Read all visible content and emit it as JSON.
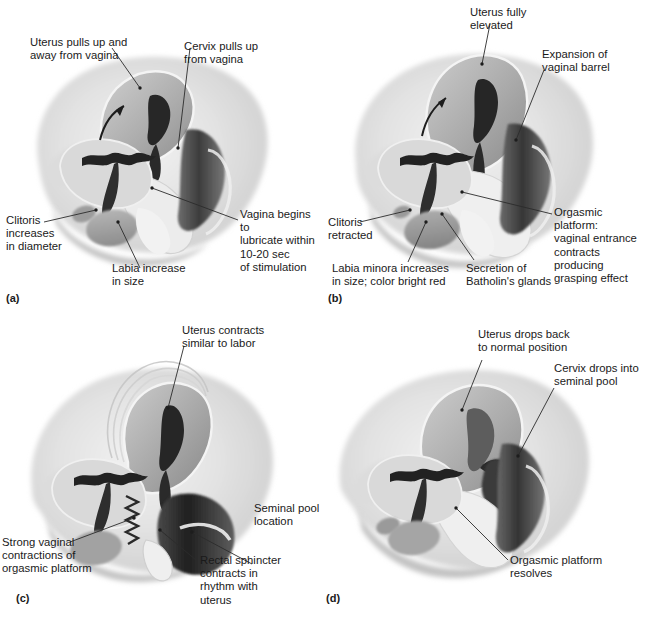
{
  "figure": {
    "panel_count": 4
  },
  "panels": [
    {
      "letter": "(a)",
      "phase_name": "Excitement phase",
      "callouts": [
        {
          "id": "uterus-pulls-up",
          "text": "Uterus pulls up and\naway from vagina"
        },
        {
          "id": "cervix-pulls-up",
          "text": "Cervix pulls up\nfrom vagina"
        },
        {
          "id": "vagina-lubricates",
          "text": "Vagina begins to\nlubricate within\n10-20 sec\nof stimulation"
        },
        {
          "id": "clitoris-increases",
          "text": "Clitoris\nincreases\nin diameter"
        },
        {
          "id": "labia-increase",
          "text": "Labia increase\nin size"
        }
      ]
    },
    {
      "letter": "(b)",
      "phase_name": "Plateau phase",
      "callouts": [
        {
          "id": "uterus-fully-elevated",
          "text": "Uterus fully\nelevated"
        },
        {
          "id": "expansion-vaginal-barrel",
          "text": "Expansion of\nvaginal barrel"
        },
        {
          "id": "orgasmic-platform",
          "text": "Orgasmic platform:\nvaginal entrance\ncontracts producing\ngrasping effect"
        },
        {
          "id": "clitoris-retracted",
          "text": "Clitoris\nretracted"
        },
        {
          "id": "labia-minora-increases",
          "text": "Labia minora increases\nin size; color bright red"
        },
        {
          "id": "secretion-batholins",
          "text": "Secretion of\nBatholin's glands"
        }
      ]
    },
    {
      "letter": "(c)",
      "phase_name": "Orgasm phase",
      "callouts": [
        {
          "id": "uterus-contracts",
          "text": "Uterus contracts\nsimilar to labor"
        },
        {
          "id": "seminal-pool-location",
          "text": "Seminal pool\nlocation"
        },
        {
          "id": "strong-vaginal-contractions",
          "text": "Strong vaginal\ncontractions of\norgasmic platform"
        },
        {
          "id": "rectal-sphincter-contracts",
          "text": "Rectal sphincter\ncontracts in\nrhythm with\nuterus"
        }
      ]
    },
    {
      "letter": "(d)",
      "phase_name": "Resolution phase",
      "callouts": [
        {
          "id": "uterus-drops-back",
          "text": "Uterus drops back\nto normal position"
        },
        {
          "id": "cervix-drops-seminal-pool",
          "text": "Cervix drops into\nseminal pool"
        },
        {
          "id": "orgasmic-platform-resolves",
          "text": "Orgasmic platform resolves"
        }
      ]
    }
  ],
  "colors": {
    "background": "#ffffff",
    "text": "#1a1a1a",
    "leader_line": "#2b2b2b",
    "tissue_light": "#e3e3e3",
    "tissue_mid": "#b9b9b9",
    "tissue_dark": "#6f6f6f",
    "cavity_dark": "#2d2d2d"
  }
}
